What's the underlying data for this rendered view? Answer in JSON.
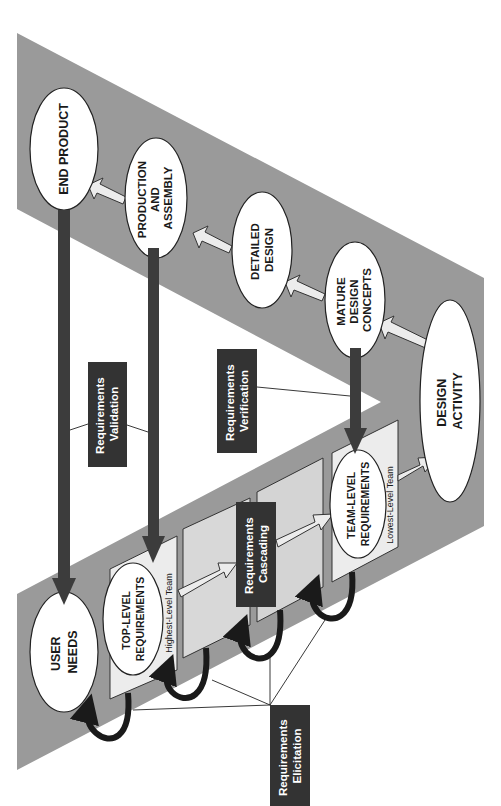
{
  "diagram": {
    "type": "V-model requirements flow (rotated 90° counter-clockwise)",
    "colors": {
      "band": "#9a9a9a",
      "panel": "#dcdcdc",
      "panel_front": "#ececec",
      "ellipse": "#ffffff",
      "dark_arrow": "#3c3c3c",
      "label_box": "#333333",
      "hollow_arrow": "#ececec"
    },
    "nodes": {
      "end_product": {
        "lines": [
          "END PRODUCT"
        ]
      },
      "production": {
        "lines": [
          "PRODUCTION",
          "AND",
          "ASSEMBLY"
        ]
      },
      "detailed_design": {
        "lines": [
          "DETAILED",
          "DESIGN"
        ]
      },
      "mature_design": {
        "lines": [
          "MATURE",
          "DESIGN",
          "CONCEPTS"
        ]
      },
      "design_activity": {
        "lines": [
          "DESIGN",
          "ACTIVITY"
        ]
      },
      "user_needs": {
        "lines": [
          "USER",
          "NEEDS"
        ]
      },
      "top_level": {
        "lines": [
          "TOP-LEVEL",
          "REQUIREMENTS"
        ]
      },
      "team_level": {
        "lines": [
          "TEAM-LEVEL",
          "REQUIREMENTS"
        ]
      }
    },
    "panel_labels": {
      "highest": "Highest-Level Team",
      "lowest": "Lowest-Level Team"
    },
    "callouts": {
      "validation": {
        "lines": [
          "Requirements",
          "Validation"
        ]
      },
      "verification": {
        "lines": [
          "Requirements",
          "Verification"
        ]
      },
      "cascading": {
        "lines": [
          "Requirements",
          "Cascading"
        ]
      },
      "elicitation": {
        "lines": [
          "Requirements",
          "Elicitation"
        ]
      }
    }
  }
}
